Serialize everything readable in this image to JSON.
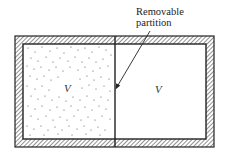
{
  "diagram": {
    "annotation": {
      "line1": "Removable",
      "line2": "partition"
    },
    "chambers": [
      {
        "id": "left",
        "label": "V",
        "contents": "gas (stippled)"
      },
      {
        "id": "right",
        "label": "V",
        "contents": "vacuum (empty)"
      }
    ],
    "colors": {
      "wall_stroke": "#222222",
      "hatch": "#555555",
      "dots": "#555555",
      "background": "#ffffff"
    }
  }
}
